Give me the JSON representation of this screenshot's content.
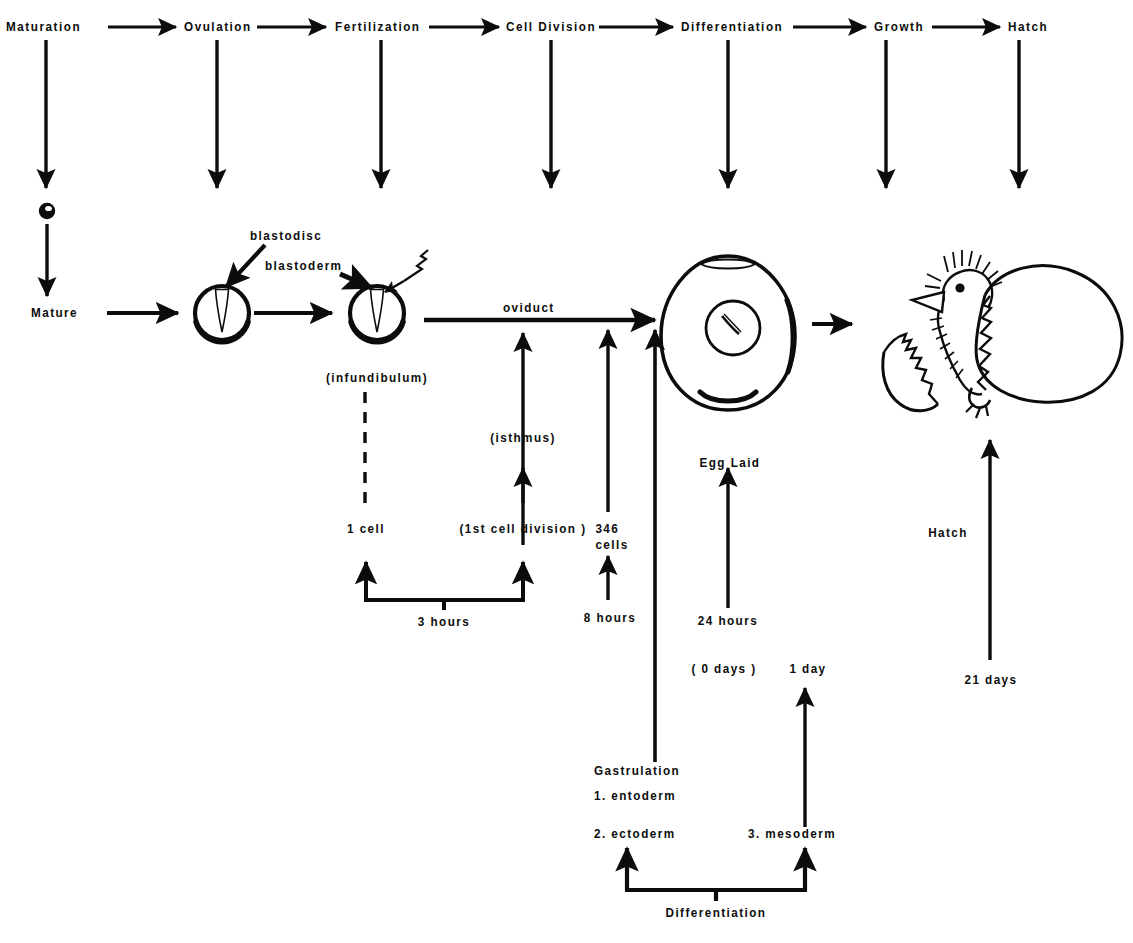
{
  "diagram": {
    "stroke_color": "#0c0c0c",
    "background_color": "#ffffff",
    "stages": [
      {
        "label": "Maturation"
      },
      {
        "label": "Ovulation"
      },
      {
        "label": "Fertilization"
      },
      {
        "label": "Cell Division"
      },
      {
        "label": "Differentiation"
      },
      {
        "label": "Growth"
      },
      {
        "label": "Hatch"
      }
    ],
    "ovum_row": {
      "mature_label": "Mature",
      "oviduct_label": "oviduct",
      "callouts": [
        {
          "label": "blastodisc"
        },
        {
          "label": "blastoderm"
        }
      ],
      "infundibulum_label": "(infundibulum)",
      "isthmus_label": "(isthmus)",
      "egg_laid_label": "Egg  Laid",
      "hatch_label": "Hatch"
    },
    "cell_counts": {
      "one_cell": "1 cell",
      "first_division": "(1st  cell  division )",
      "cells_346": "346\ncells"
    },
    "timings": {
      "three_hours": "3  hours",
      "eight_hours": "8  hours",
      "twentyfour_hours": "24  hours",
      "zero_days": "( 0  days )",
      "one_day": "1  day",
      "twentyone_days": "21  days"
    },
    "gastrulation": {
      "heading": "Gastrulation",
      "germ_layers": [
        {
          "label": "1.  entoderm"
        },
        {
          "label": "2.  ectoderm"
        },
        {
          "label": "3.  mesoderm"
        }
      ],
      "differentiation_label": "Differentiation"
    },
    "illustrations": [
      {
        "name": "ovum-small"
      },
      {
        "name": "ovum-blastodisc"
      },
      {
        "name": "ovum-blastoderm"
      },
      {
        "name": "laid-egg"
      },
      {
        "name": "hatching-chick"
      }
    ]
  }
}
